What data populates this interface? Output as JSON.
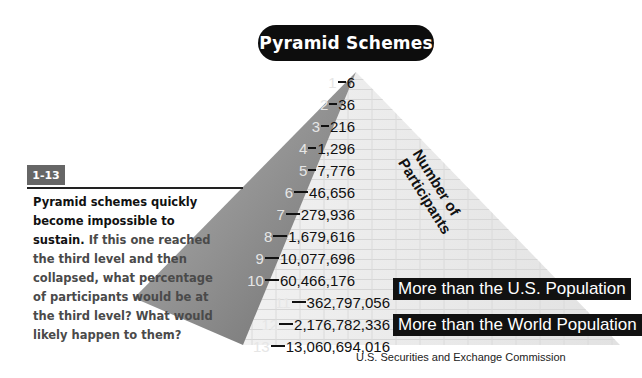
{
  "title": "Pyramid Schemes",
  "pyramid": {
    "levels_label": "Levels",
    "participants_label_line1": "Number of",
    "participants_label_line2": "Participants",
    "rows": [
      {
        "level": "1",
        "value": "6"
      },
      {
        "level": "2",
        "value": "36"
      },
      {
        "level": "3",
        "value": "216"
      },
      {
        "level": "4",
        "value": "1,296"
      },
      {
        "level": "5",
        "value": "7,776"
      },
      {
        "level": "6",
        "value": "46,656"
      },
      {
        "level": "7",
        "value": "279,936"
      },
      {
        "level": "8",
        "value": "1,679,616"
      },
      {
        "level": "9",
        "value": "10,077,696"
      },
      {
        "level": "10",
        "value": "60,466,176"
      },
      {
        "level": "11",
        "value": "362,797,056"
      },
      {
        "level": "12",
        "value": "2,176,782,336"
      },
      {
        "level": "13",
        "value": "13,060,694,016"
      }
    ],
    "callouts": {
      "level11": "More than the U.S. Population",
      "level13": "More than the World Population"
    },
    "colors": {
      "dark_face": "#8a8a8a",
      "light_face": "#ececec",
      "callout_bg": "#111111"
    }
  },
  "sidebar": {
    "badge": "1-13",
    "lead": "Pyramid schemes quickly become impossible to sustain.",
    "body": " If this one reached the third level and then collapsed, what percentage of participants would be at the third level? What would likely happen to them?"
  },
  "source": "U.S. Securities and Exchange Commission"
}
